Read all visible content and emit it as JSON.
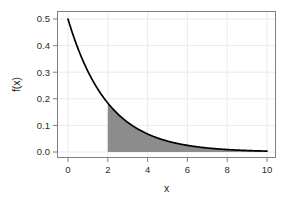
{
  "chart_data": {
    "type": "area",
    "title": "",
    "subtitle": "",
    "xlabel": "x",
    "ylabel": "f(x)",
    "xlim": [
      0,
      10
    ],
    "ylim": [
      0.0,
      0.5
    ],
    "grid": true,
    "legend": null,
    "legend_position": "none",
    "background_color": "#ffffff",
    "panel_border_color": "#7f7f7f",
    "grid_color": "#ebebeb",
    "curve_color": "#000000",
    "fill_color": "#8c8c8c",
    "function": {
      "formula": "0.5 * exp(-0.5 * x)",
      "rate": 0.5,
      "scale": 2
    },
    "shaded_region": {
      "from": 2,
      "to": 10,
      "color": "#8c8c8c",
      "label": ""
    },
    "xticks": [
      0,
      2,
      4,
      6,
      8,
      10
    ],
    "xtick_labels": [
      "0",
      "2",
      "4",
      "6",
      "8",
      "10"
    ],
    "yticks": [
      0.0,
      0.1,
      0.2,
      0.3,
      0.4,
      0.5
    ],
    "ytick_labels": [
      "0.0",
      "0.1",
      "0.2",
      "0.3",
      "0.4",
      "0.5"
    ],
    "x": [
      0.0,
      0.25,
      0.5,
      0.75,
      1.0,
      1.25,
      1.5,
      1.75,
      2.0,
      2.25,
      2.5,
      2.75,
      3.0,
      3.25,
      3.5,
      3.75,
      4.0,
      4.25,
      4.5,
      4.75,
      5.0,
      5.25,
      5.5,
      5.75,
      6.0,
      6.25,
      6.5,
      6.75,
      7.0,
      7.25,
      7.5,
      7.75,
      8.0,
      8.25,
      8.5,
      8.75,
      9.0,
      9.25,
      9.5,
      9.75,
      10.0
    ],
    "values": [
      0.5,
      0.4412,
      0.3894,
      0.3436,
      0.3033,
      0.2676,
      0.2362,
      0.2084,
      0.1839,
      0.1623,
      0.1433,
      0.1264,
      0.1116,
      0.0985,
      0.0869,
      0.0767,
      0.0677,
      0.0597,
      0.0527,
      0.0465,
      0.041,
      0.0362,
      0.032,
      0.0282,
      0.0249,
      0.022,
      0.0194,
      0.0171,
      0.0151,
      0.0133,
      0.0118,
      0.0104,
      0.0092,
      0.0081,
      0.0071,
      0.0063,
      0.0056,
      0.0049,
      0.0043,
      0.0038,
      0.0034
    ]
  }
}
